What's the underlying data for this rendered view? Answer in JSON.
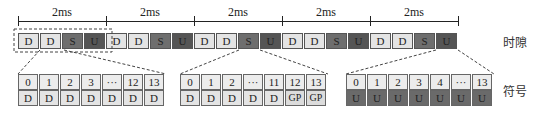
{
  "frames": [
    {
      "duration": "2ms",
      "slots": [
        "D",
        "D",
        "S",
        "U"
      ]
    },
    {
      "duration": "2ms",
      "slots": [
        "D",
        "D",
        "S",
        "U"
      ]
    },
    {
      "duration": "2ms",
      "slots": [
        "D",
        "D",
        "S",
        "U"
      ]
    },
    {
      "duration": "2ms",
      "slots": [
        "D",
        "D",
        "S",
        "U"
      ]
    },
    {
      "duration": "2ms",
      "slots": [
        "D",
        "D",
        "S",
        "U"
      ]
    }
  ],
  "labels": {
    "slot_row": "时隙",
    "symbol_row": "符号"
  },
  "symbol_groups": [
    {
      "name": "D-slot",
      "indices": [
        "0",
        "1",
        "2",
        "3",
        "···",
        "12",
        "13"
      ],
      "symbols": [
        "D",
        "D",
        "D",
        "D",
        "D",
        "D",
        "D"
      ]
    },
    {
      "name": "S-slot",
      "indices": [
        "0",
        "1",
        "2",
        "···",
        "11",
        "12",
        "13"
      ],
      "symbols": [
        "D",
        "D",
        "D",
        "D",
        "D",
        "GP",
        "GP"
      ]
    },
    {
      "name": "U-slot",
      "indices": [
        "0",
        "1",
        "2",
        "3",
        "4",
        "···",
        "13"
      ],
      "symbols": [
        "U",
        "U",
        "U",
        "U",
        "U",
        "U",
        "U"
      ]
    }
  ],
  "colors": {
    "downlink": "#e4e4e4",
    "special": "#6e6e6e",
    "uplink": "#555555"
  }
}
